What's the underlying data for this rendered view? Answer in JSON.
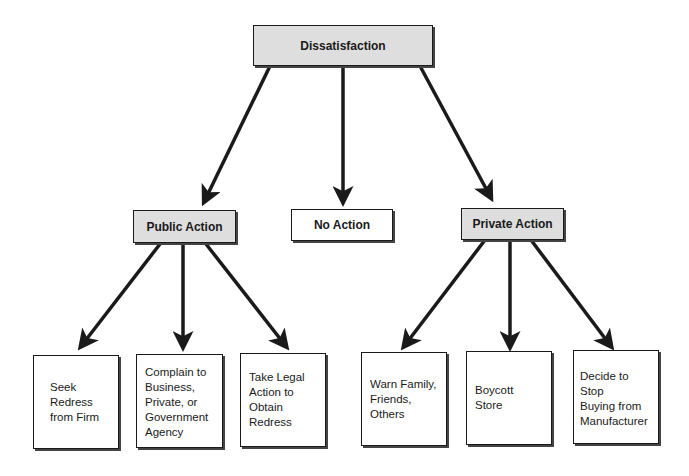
{
  "diagram": {
    "root": {
      "label": "Dissatisfaction",
      "fill": "#dedede"
    },
    "level2": [
      {
        "label": "Public Action",
        "fill": "#dedede"
      },
      {
        "label": "No Action",
        "fill": "#ffffff"
      },
      {
        "label": "Private Action",
        "fill": "#dedede"
      }
    ],
    "public_children": [
      {
        "label": "Seek\nRedress\nfrom Firm"
      },
      {
        "label": "Complain to\nBusiness,\nPrivate, or\nGovernment\nAgency"
      },
      {
        "label": "Take Legal\nAction to\nObtain\nRedress"
      }
    ],
    "private_children": [
      {
        "label": "Warn Family,\nFriends, Others"
      },
      {
        "label": "Boycott Store"
      },
      {
        "label": "Decide to Stop\nBuying from\nManufacturer"
      }
    ]
  }
}
